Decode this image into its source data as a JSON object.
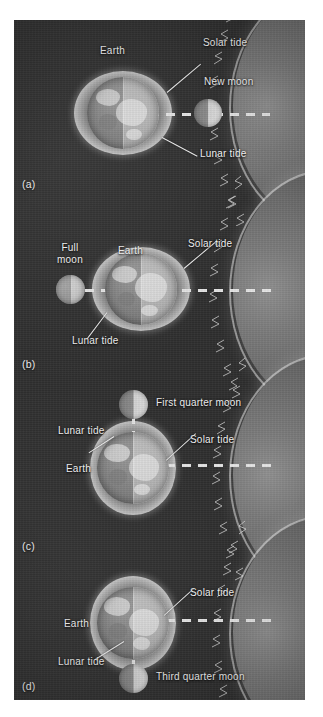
{
  "figure": {
    "caption_panels": [
      "(a)",
      "(b)",
      "(c)",
      "(d)"
    ],
    "background_color": "#2e2e2e",
    "label_color": "#f2f2f2"
  },
  "labels": {
    "earth": "Earth",
    "solar_tide": "Solar tide",
    "lunar_tide": "Lunar tide",
    "new_moon": "New moon",
    "full_moon_line1": "Full",
    "full_moon_line2": "moon",
    "first_quarter_moon": "First quarter moon",
    "third_quarter_moon": "Third quarter moon"
  },
  "panels": [
    {
      "tag": "(a)",
      "moon_phase": "new-moon",
      "moon_label": "New moon",
      "moon_position": "right-of-earth",
      "tide_alignment": "spring",
      "bulge_orientation": "horizontal",
      "labels": [
        "Earth",
        "Solar tide",
        "New moon",
        "Lunar tide"
      ]
    },
    {
      "tag": "(b)",
      "moon_phase": "full-moon",
      "moon_label": "Full moon",
      "moon_position": "left-of-earth",
      "tide_alignment": "spring",
      "bulge_orientation": "horizontal",
      "labels": [
        "Full",
        "moon",
        "Earth",
        "Solar tide",
        "Lunar tide"
      ]
    },
    {
      "tag": "(c)",
      "moon_phase": "first-quarter",
      "moon_label": "First quarter moon",
      "moon_position": "above-earth",
      "tide_alignment": "neap",
      "bulge_orientation": "vertical",
      "labels": [
        "First quarter moon",
        "Lunar tide",
        "Solar tide",
        "Earth"
      ]
    },
    {
      "tag": "(d)",
      "moon_phase": "third-quarter",
      "moon_label": "Third quarter moon",
      "moon_position": "below-earth",
      "tide_alignment": "neap",
      "bulge_orientation": "vertical",
      "labels": [
        "Solar tide",
        "Earth",
        "Lunar tide",
        "Third quarter moon"
      ]
    }
  ],
  "sun": {
    "name": "sun-limb",
    "position": "right-edge"
  }
}
